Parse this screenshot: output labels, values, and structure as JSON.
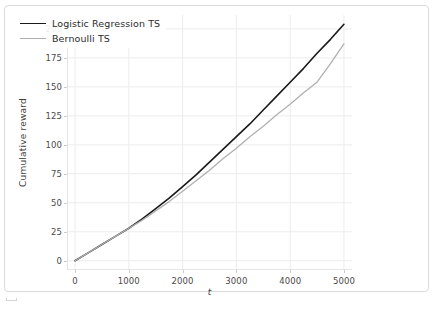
{
  "chart_data": {
    "type": "line",
    "title": "",
    "xlabel": "t",
    "ylabel": "Cumulative reward",
    "xlim": [
      -150,
      5150
    ],
    "ylim": [
      -8,
      212
    ],
    "grid": true,
    "legend_position": "upper left",
    "xticks": [
      0,
      1000,
      2000,
      3000,
      4000,
      5000
    ],
    "yticks": [
      0,
      25,
      50,
      75,
      100,
      125,
      150,
      175,
      200
    ],
    "x": [
      0,
      250,
      500,
      750,
      1000,
      1250,
      1500,
      1750,
      2000,
      2250,
      2500,
      2750,
      3000,
      3250,
      3500,
      3750,
      4000,
      4250,
      4500,
      4750,
      5000
    ],
    "series": [
      {
        "name": "Logistic Regression TS",
        "color": "#1a1a1a",
        "width": 1.6,
        "values": [
          0,
          7,
          14,
          21,
          28,
          36,
          45,
          54,
          64,
          74,
          85,
          96,
          107,
          118,
          130,
          142,
          154,
          166,
          179,
          191,
          204
        ]
      },
      {
        "name": "Bernoulli TS",
        "color": "#b0b0b0",
        "width": 1.3,
        "values": [
          0,
          7,
          14,
          21,
          28,
          35,
          43,
          51,
          60,
          69,
          78,
          88,
          97,
          107,
          116,
          126,
          135,
          145,
          154,
          170,
          187
        ]
      }
    ]
  },
  "figure": {
    "background": "#ffffff",
    "border_color": "#d8dadd",
    "grid_color": "#ececec",
    "spine_color": "#c9ccd0",
    "tick_text_color": "#4a4a4a"
  },
  "caption": {
    "text": ""
  }
}
